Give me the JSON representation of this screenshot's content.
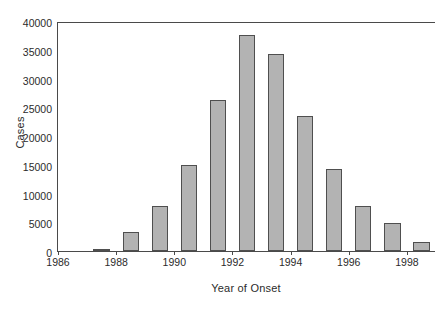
{
  "chart_data": {
    "type": "bar",
    "title": "",
    "subtitle": "",
    "xlabel": "Year of Onset",
    "ylabel": "Cases",
    "categories": [
      1987,
      1988,
      1989,
      1990,
      1991,
      1992,
      1993,
      1994,
      1995,
      1996,
      1997,
      1998
    ],
    "values": [
      400,
      3300,
      7900,
      15000,
      26300,
      37600,
      34200,
      23400,
      14300,
      7800,
      4800,
      1600
    ],
    "series": [
      {
        "name": "Cases",
        "values": [
          400,
          3300,
          7900,
          15000,
          26300,
          37600,
          34200,
          23400,
          14300,
          7800,
          4800,
          1600
        ]
      }
    ],
    "xlim": [
      1986,
      1999
    ],
    "ylim": [
      0,
      40000
    ],
    "yticks": [
      0,
      5000,
      10000,
      15000,
      20000,
      25000,
      30000,
      35000,
      40000
    ],
    "ytick_labels": [
      "0",
      "5000",
      "10000",
      "15000",
      "20000",
      "25000",
      "30000",
      "35000",
      "40000"
    ],
    "xticks": [
      1986,
      1988,
      1990,
      1992,
      1994,
      1996,
      1998
    ],
    "xtick_labels": [
      "1986",
      "1988",
      "1990",
      "1992",
      "1994",
      "1996",
      "1998"
    ],
    "grid": false,
    "legend": false,
    "legend_position": "none",
    "bar_fill_color": "#b3b3b3",
    "bar_edge_color": "#4f4f4f",
    "axis_color": "#4a4a4a",
    "background_color": "#ffffff",
    "annotations": []
  }
}
